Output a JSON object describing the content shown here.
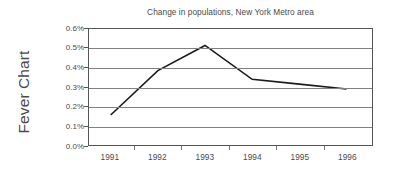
{
  "figure": {
    "ylabel": "Fever Chart",
    "line_color": "#1a1a1a",
    "grid_color": "#808080",
    "frame_color": "#555555",
    "text_color": "#4a4a4a",
    "background": "#ffffff"
  },
  "chart_data": {
    "type": "line",
    "title": "Change in populations, New York Metro area",
    "xlabel": "",
    "ylabel": "Fever Chart",
    "categories": [
      "1991",
      "1992",
      "1993",
      "1994",
      "1995",
      "1996"
    ],
    "values": [
      0.155,
      0.385,
      0.515,
      0.34,
      0.315,
      0.29
    ],
    "value_suffix": "%",
    "series": [
      {
        "name": "Change in populations",
        "values": [
          0.155,
          0.385,
          0.515,
          0.34,
          0.315,
          0.29
        ]
      }
    ],
    "ylim": [
      0.0,
      0.6
    ],
    "ytick_values": [
      0.0,
      0.1,
      0.2,
      0.3,
      0.4,
      0.5,
      0.6
    ],
    "ytick_labels": [
      "0.0%",
      "0.1%",
      "0.2%",
      "0.3%",
      "0.4%",
      "0.5%",
      "0.6%"
    ],
    "xtick_labels": [
      "1991",
      "1992",
      "1993",
      "1994",
      "1995",
      "1996"
    ],
    "grid": "horizontal",
    "legend": "none",
    "markers": "none"
  }
}
